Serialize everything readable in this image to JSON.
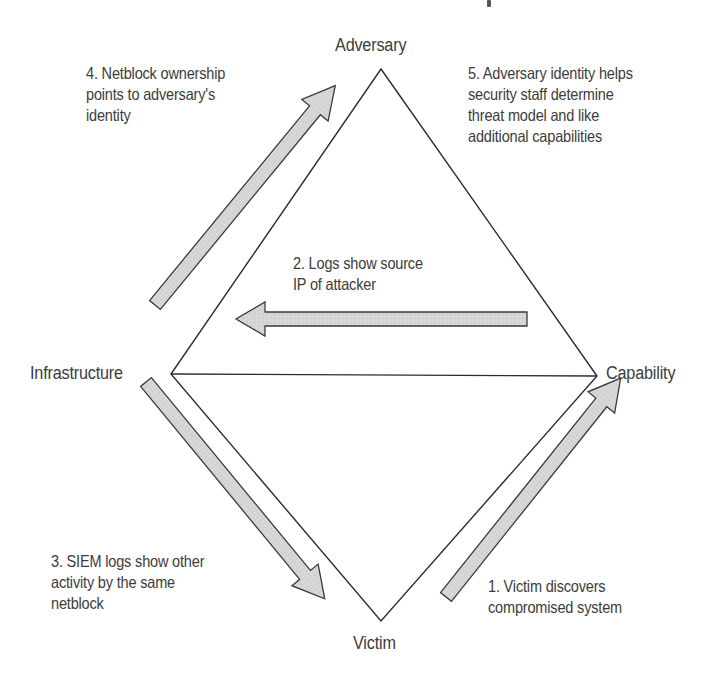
{
  "diagram": {
    "type": "diamond-model-of-intrusion-analysis",
    "vertices": {
      "adversary": "Adversary",
      "infrastructure": "Infrastructure",
      "capability": "Capability",
      "victim": "Victim"
    },
    "steps": [
      {
        "number": 1,
        "lines": [
          "1. Victim discovers",
          "compromised system"
        ],
        "direction": "victim-to-capability"
      },
      {
        "number": 2,
        "lines": [
          "2. Logs show source",
          "IP of attacker"
        ],
        "direction": "capability-to-infrastructure"
      },
      {
        "number": 3,
        "lines": [
          "3. SIEM logs show other",
          "activity by the same",
          "netblock"
        ],
        "direction": "infrastructure-to-victim"
      },
      {
        "number": 4,
        "lines": [
          "4. Netblock ownership",
          "points to adversary's",
          "identity"
        ],
        "direction": "infrastructure-to-adversary"
      },
      {
        "number": 5,
        "lines": [
          "5. Adversary identity helps",
          "security staff determine",
          "threat model and like",
          "additional capabilities"
        ],
        "direction": "adversary-to-capability"
      }
    ],
    "colors": {
      "line": "#2b2b2b",
      "arrow_fill": "#d4d4d4",
      "arrow_stroke": "#3a3a3a",
      "text": "#3c3c3c",
      "background": "#ffffff"
    }
  }
}
